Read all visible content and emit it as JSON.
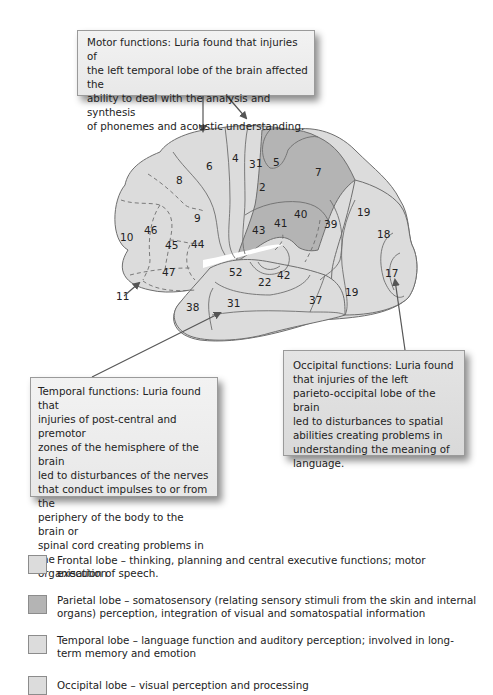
{
  "callouts": {
    "motor": "Motor functions: Luria found that injuries of\nthe left temporal lobe of the brain affected the\nability to deal with the analysis and synthesis\nof phonemes and acoustic understanding.",
    "temporal": "Temporal functions: Luria found that\ninjuries of post-central and premotor\nzones of the hemisphere of the brain\nled to disturbances of the nerves\nthat conduct impulses to or from the\nperiphery of the body to the brain or\nspinal cord creating problems in the\norganisation of speech.",
    "occipital": "Occipital functions: Luria found\nthat injuries of the left\nparieto-occipital lobe of the brain\nled to disturbances to spatial\nabilities creating problems in\nunderstanding the meaning of\nlanguage."
  },
  "brodmann_areas": {
    "a1": "1",
    "a2": "2",
    "a3": "3",
    "a4": "4",
    "a5": "5",
    "a6": "6",
    "a7": "7",
    "a8": "8",
    "a9": "9",
    "a10": "10",
    "a11": "11",
    "a17": "17",
    "a18": "18",
    "a19a": "19",
    "a19b": "19",
    "a22": "22",
    "a31": "31",
    "a37": "37",
    "a38": "38",
    "a39": "39",
    "a40": "40",
    "a41": "41",
    "a42": "42",
    "a43": "43",
    "a44": "44",
    "a45": "45",
    "a46": "46",
    "a47": "47",
    "a52": "52"
  },
  "colors": {
    "frontal": "#dcdcdc",
    "parietal": "#b4b4b4",
    "temporal": "#dcdcdc",
    "occipital": "#dcdcdc",
    "outline": "#6e6e6e",
    "arrow": "#555555"
  },
  "legend": [
    {
      "lobe": "frontal",
      "text": "Frontal lobe – thinking, planning and central executive functions; motor execution"
    },
    {
      "lobe": "parietal",
      "text": "Parietal lobe – somatosensory (relating sensory stimuli from the skin and internal organs) perception, integration of visual and somatospatial information"
    },
    {
      "lobe": "temporal",
      "text": "Temporal lobe – language function and auditory perception; involved in long-term memory and emotion"
    },
    {
      "lobe": "occipital",
      "text": "Occipital lobe – visual perception and processing"
    }
  ]
}
